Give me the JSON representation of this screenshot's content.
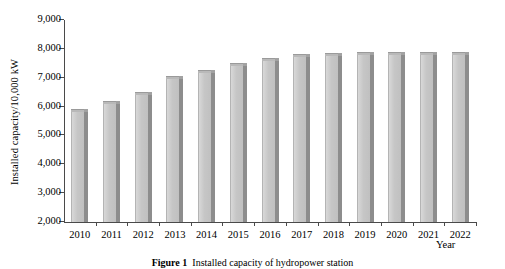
{
  "chart_data": {
    "type": "bar",
    "title": "",
    "xlabel": "Year",
    "ylabel": "Installed capacity/10,000 kW",
    "categories": [
      "2010",
      "2011",
      "2012",
      "2013",
      "2014",
      "2015",
      "2016",
      "2017",
      "2018",
      "2019",
      "2020",
      "2021",
      "2022"
    ],
    "values": [
      5900,
      6180,
      6520,
      7070,
      7280,
      7500,
      7700,
      7830,
      7860,
      7880,
      7880,
      7880,
      7880
    ],
    "ylim": [
      2000,
      9000
    ],
    "yticks": [
      2000,
      3000,
      4000,
      5000,
      6000,
      7000,
      8000,
      9000
    ],
    "ytick_labels": [
      "2,000",
      "3,000",
      "4,000",
      "5,000",
      "6,000",
      "7,000",
      "8,000",
      "9,000"
    ],
    "grid": false,
    "legend": null,
    "series": [
      {
        "name": "Installed capacity",
        "values": [
          5900,
          6180,
          6520,
          7070,
          7280,
          7500,
          7700,
          7830,
          7860,
          7880,
          7880,
          7880,
          7880
        ]
      }
    ],
    "bar_face_color": "#c6c6c6",
    "bar_side_color": "#8d8d8d",
    "axis_color": "#4a4a4a"
  },
  "figure": {
    "caption_label": "Figure 1",
    "caption_text": "Installed capacity of hydropower station"
  }
}
